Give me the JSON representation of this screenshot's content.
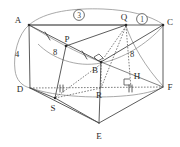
{
  "figure": {
    "kind": "solid-geometry-diagram",
    "vertices": [
      {
        "name": "A",
        "label": "A",
        "x": 29,
        "y": 25,
        "label_x": 18,
        "label_y": 20
      },
      {
        "name": "C",
        "label": "C",
        "x": 163,
        "y": 25,
        "label_x": 169,
        "label_y": 23
      },
      {
        "name": "D",
        "label": "D",
        "x": 30,
        "y": 88,
        "label_x": 20,
        "label_y": 91
      },
      {
        "name": "F",
        "label": "F",
        "x": 163,
        "y": 87,
        "label_x": 169,
        "label_y": 88
      },
      {
        "name": "E",
        "label": "E",
        "x": 99,
        "y": 123,
        "label_x": 96,
        "label_y": 137
      },
      {
        "name": "B",
        "label": "B",
        "x": 101,
        "y": 62,
        "label_x": 93,
        "label_y": 73
      },
      {
        "name": "P",
        "label": "P",
        "x": 66,
        "y": 46,
        "label_x": 64,
        "label_y": 41
      },
      {
        "name": "Q",
        "label": "Q",
        "x": 126,
        "y": 25,
        "label_x": 121,
        "label_y": 19
      },
      {
        "name": "R",
        "label": "R",
        "x": 101,
        "y": 88,
        "label_x": 95,
        "label_y": 98
      },
      {
        "name": "S",
        "label": "S",
        "x": 55,
        "y": 98,
        "label_x": 50,
        "label_y": 110
      },
      {
        "name": "H",
        "label": "H",
        "x": 131,
        "y": 88,
        "label_x": 134,
        "label_y": 78
      }
    ],
    "measures": [
      {
        "name": "length-AD",
        "text": "4",
        "x": 17,
        "y": 57
      },
      {
        "name": "length-AP",
        "text": "8",
        "x": 55,
        "y": 55
      },
      {
        "name": "length-QC",
        "text": "8",
        "x": 132,
        "y": 57
      }
    ],
    "circled_labels": [
      {
        "name": "circled-three",
        "text": "3",
        "x": 79,
        "y": 15
      },
      {
        "name": "circled-one",
        "text": "1",
        "x": 142,
        "y": 19
      }
    ],
    "marks": [
      {
        "name": "single-tick-AP",
        "kind": "single"
      },
      {
        "name": "single-tick-PB",
        "kind": "single"
      },
      {
        "name": "double-tick-DS",
        "kind": "double"
      },
      {
        "name": "double-tick-RH",
        "kind": "double"
      },
      {
        "name": "right-angle-B",
        "kind": "right-angle"
      },
      {
        "name": "right-angle-H",
        "kind": "right-angle"
      }
    ],
    "colors": {
      "stroke": "#4a4a4a",
      "hidden": "#5f5f5f",
      "arc": "#8c8c8c",
      "text": "#2b2b2b",
      "background": "#ffffff"
    }
  }
}
